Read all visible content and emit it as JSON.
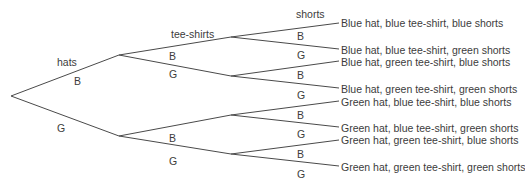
{
  "diagram": {
    "type": "tree-diagram",
    "stage_headers": {
      "hats": "hats",
      "tee_shirts": "tee-shirts",
      "shorts": "shorts"
    },
    "branch_labels": {
      "hats": [
        "B",
        "G"
      ],
      "tee_shirts": [
        "B",
        "G",
        "B",
        "G"
      ],
      "shorts": [
        "B",
        "G",
        "B",
        "G",
        "B",
        "G",
        "B",
        "G"
      ]
    },
    "outcomes": [
      "Blue hat, blue tee-shirt, blue shorts",
      "Blue hat, blue tee-shirt, green shorts",
      "Blue hat, green tee-shirt, blue shorts",
      "Blue hat, green tee-shirt, green shorts",
      "Green hat, blue tee-shirt, blue shorts",
      "Green hat, blue tee-shirt, green shorts",
      "Green hat, green tee-shirt, blue shorts",
      "Green hat, green tee-shirt, green shorts"
    ],
    "line_color": "#4a4a4a"
  }
}
